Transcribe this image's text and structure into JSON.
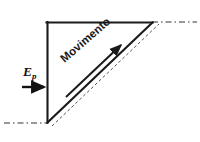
{
  "figure": {
    "background_color": "#ffffff",
    "stroke_color": "#1a1a1a",
    "dash_color": "#333333",
    "width": 200,
    "height": 142
  },
  "labels": {
    "motion_label": "Movimento",
    "force_symbol": "E",
    "force_subscript": "p"
  },
  "geometry": {
    "triangle": {
      "top_left": [
        47,
        22
      ],
      "top_right": [
        152,
        22
      ],
      "bottom_left": [
        48,
        122
      ]
    },
    "hypotenuse": {
      "from": [
        48,
        122
      ],
      "to": [
        152,
        22
      ]
    },
    "dashed_parallel": {
      "from": [
        53,
        124
      ],
      "to": [
        158,
        24
      ]
    },
    "ground_dash": {
      "from": [
        4,
        123
      ],
      "to": [
        48,
        123
      ]
    },
    "upper_dash": {
      "from": [
        152,
        22
      ],
      "to": [
        197,
        22
      ]
    }
  },
  "vectors": {
    "motion_arrow": {
      "name": "Movimento",
      "from": [
        67,
        96
      ],
      "to": [
        124,
        42
      ],
      "direction": "up-right along incline"
    },
    "force_arrow": {
      "name": "Ep",
      "from": [
        22,
        87
      ],
      "to": [
        47,
        87
      ],
      "direction": "right, horizontal"
    }
  }
}
